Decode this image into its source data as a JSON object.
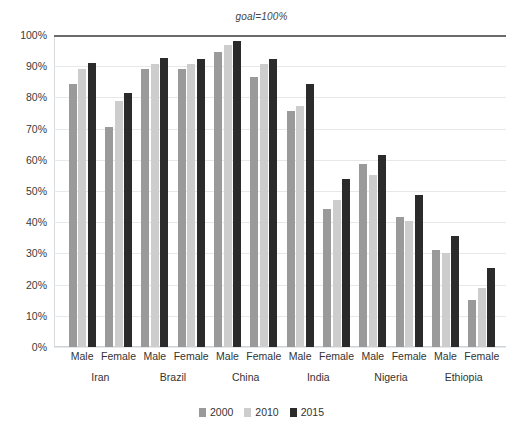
{
  "annotation": {
    "goal_label": "goal=100%"
  },
  "axis": {
    "y_ticks": [
      "100%",
      "90%",
      "80%",
      "70%",
      "60%",
      "50%",
      "40%",
      "30%",
      "20%",
      "10%",
      "0%"
    ],
    "y_min": 0,
    "y_max": 100
  },
  "legend": {
    "items": [
      {
        "label": "2000",
        "color": "#9a9a9a"
      },
      {
        "label": "2010",
        "color": "#cdcdcd"
      },
      {
        "label": "2015",
        "color": "#2b2b2b"
      }
    ]
  },
  "colors": {
    "series_2000": "#9a9a9a",
    "series_2010": "#cdcdcd",
    "series_2015": "#2b2b2b",
    "goal_line": "#6b6b6b",
    "gridline": "#e6e9ec",
    "text": "#333333"
  },
  "chart_data": {
    "type": "bar",
    "title": "",
    "subtitle": "",
    "xlabel": "",
    "ylabel": "",
    "ylim": [
      0,
      100
    ],
    "grid": true,
    "legend_position": "bottom",
    "annotations": [
      {
        "text": "goal=100%",
        "y": 100,
        "style": "italic-horizontal-line"
      }
    ],
    "groups": [
      "Iran",
      "Brazil",
      "China",
      "India",
      "Nigeria",
      "Ethiopia"
    ],
    "subgroups": [
      "Male",
      "Female"
    ],
    "categories": [
      "Iran Male",
      "Iran Female",
      "Brazil Male",
      "Brazil Female",
      "China Male",
      "China Female",
      "India Male",
      "India Female",
      "Nigeria Male",
      "Nigeria Female",
      "Ethiopia Male",
      "Ethiopia Female"
    ],
    "series": [
      {
        "name": "2000",
        "color": "#9a9a9a",
        "values": [
          84.3,
          70.6,
          89.0,
          89.0,
          94.5,
          86.4,
          75.8,
          44.3,
          58.8,
          41.8,
          31.2,
          15.0
        ]
      },
      {
        "name": "2010",
        "color": "#cdcdcd",
        "values": [
          89.0,
          79.0,
          90.8,
          90.8,
          96.7,
          90.6,
          77.3,
          47.0,
          55.2,
          40.5,
          30.2,
          19.0
        ]
      },
      {
        "name": "2015",
        "color": "#2b2b2b",
        "values": [
          90.9,
          81.5,
          92.5,
          92.3,
          98.0,
          92.3,
          84.2,
          54.0,
          61.7,
          48.6,
          35.5,
          25.3
        ]
      }
    ]
  }
}
